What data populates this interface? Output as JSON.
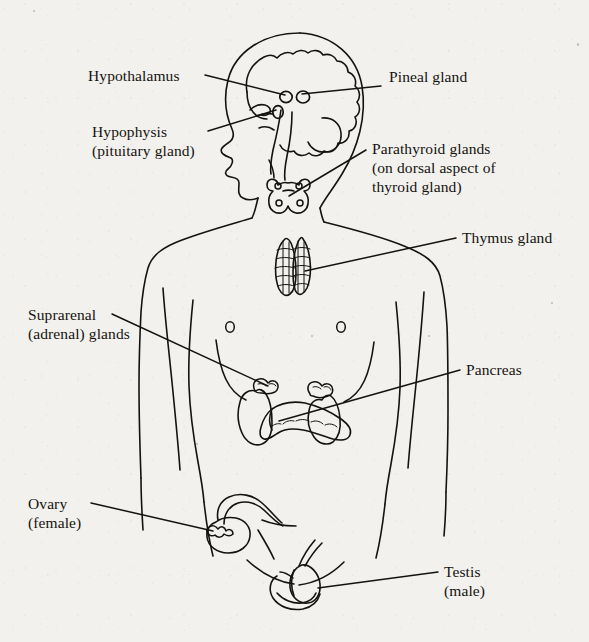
{
  "figure": {
    "background_color": "#f2f1ed",
    "ink_color": "#15130f",
    "view": "anterior body outline with head in left profile"
  },
  "labels": [
    {
      "id": "hypothalamus",
      "lines": [
        "Hypothalamus"
      ],
      "text": "Hypothalamus",
      "x": 88,
      "y": 66,
      "align": "left",
      "leader": {
        "from": [
          205,
          75
        ],
        "to": [
          285,
          95
        ]
      }
    },
    {
      "id": "pineal-gland",
      "lines": [
        "Pineal gland"
      ],
      "text": "Pineal gland",
      "x": 389,
      "y": 77,
      "align": "left",
      "leader": {
        "from": [
          381,
          86
        ],
        "to": [
          300,
          94
        ]
      }
    },
    {
      "id": "hypophysis",
      "lines": [
        "Hypophysis",
        "(pituitary gland)"
      ],
      "text": "Hypophysis\n(pituitary gland)",
      "x": 92,
      "y": 122,
      "align": "left",
      "leader": {
        "from": [
          208,
          131
        ],
        "to": [
          277,
          110
        ]
      }
    },
    {
      "id": "parathyroid-glands",
      "lines": [
        "Parathyroid glands",
        "(on dorsal aspect of",
        "thyroid gland)"
      ],
      "text": "Parathyroid glands\n(on dorsal aspect of\nthyroid gland)",
      "x": 372,
      "y": 139,
      "align": "left",
      "leader": {
        "from": [
          366,
          150
        ],
        "to": [
          289,
          196
        ]
      }
    },
    {
      "id": "thymus-gland",
      "lines": [
        "Thymus gland"
      ],
      "text": "Thymus gland",
      "x": 462,
      "y": 228,
      "align": "left",
      "leader": {
        "from": [
          456,
          238
        ],
        "to": [
          305,
          271
        ]
      }
    },
    {
      "id": "suprarenal-adrenal-glands",
      "lines": [
        "Suprarenal",
        "(adrenal) glands"
      ],
      "text": "Suprarenal\n(adrenal) glands",
      "x": 28,
      "y": 305,
      "align": "left",
      "leader": {
        "from": [
          112,
          314
        ],
        "to": [
          268,
          386
        ]
      }
    },
    {
      "id": "pancreas",
      "lines": [
        "Pancreas"
      ],
      "text": "Pancreas",
      "x": 466,
      "y": 360,
      "align": "left",
      "leader": {
        "from": [
          460,
          370
        ],
        "to": [
          279,
          421
        ]
      }
    },
    {
      "id": "ovary-female",
      "lines": [
        "Ovary",
        "(female)"
      ],
      "text": "Ovary\n(female)",
      "x": 28,
      "y": 494,
      "align": "left",
      "leader": {
        "from": [
          91,
          503
        ],
        "to": [
          213,
          531
        ]
      }
    },
    {
      "id": "testis-male",
      "lines": [
        "Testis",
        "(male)"
      ],
      "text": "Testis\n(male)",
      "x": 444,
      "y": 562,
      "align": "left",
      "leader": {
        "from": [
          438,
          572
        ],
        "to": [
          318,
          588
        ]
      }
    }
  ],
  "structures": [
    {
      "id": "body-outline",
      "name": "human body outline, head in left profile"
    },
    {
      "id": "brain",
      "name": "brain with cerebral cortex, brainstem and cerebellum"
    },
    {
      "id": "hypothalamus-marker",
      "name": "hypothalamus"
    },
    {
      "id": "pineal-marker",
      "name": "pineal gland"
    },
    {
      "id": "hypophysis-marker",
      "name": "hypophysis (pituitary gland)"
    },
    {
      "id": "thyroid-parathyroid",
      "name": "thyroid gland with four parathyroid glands"
    },
    {
      "id": "thymus",
      "name": "thymus gland, two lobes"
    },
    {
      "id": "left-nipple",
      "name": "nipple"
    },
    {
      "id": "right-nipple",
      "name": "nipple"
    },
    {
      "id": "left-kidney",
      "name": "kidney with suprarenal gland"
    },
    {
      "id": "right-kidney",
      "name": "kidney with suprarenal gland"
    },
    {
      "id": "pancreas-organ",
      "name": "pancreas"
    },
    {
      "id": "uterus-ovary",
      "name": "uterus with ovary and uterine tube"
    },
    {
      "id": "testis-organ",
      "name": "testis with scrotum and spermatic cord"
    }
  ]
}
